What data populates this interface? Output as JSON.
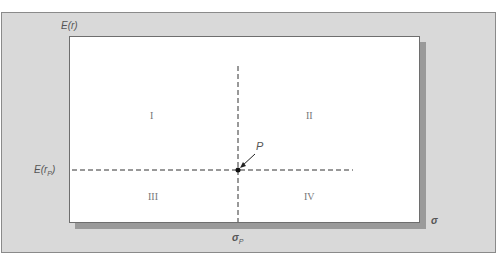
{
  "diagram": {
    "y_axis_label": "E(r)",
    "x_axis_label": "σ",
    "point_label": "P",
    "y_marker_label": "E(r",
    "y_marker_sub": "P",
    "y_marker_close": ")",
    "x_marker_label": "σ",
    "x_marker_sub": "P",
    "quadrants": [
      {
        "id": "I",
        "label": "I"
      },
      {
        "id": "II",
        "label": "II"
      },
      {
        "id": "III",
        "label": "III"
      },
      {
        "id": "IV",
        "label": "IV"
      }
    ],
    "colors": {
      "frame": "#d9d9d9",
      "plot": "#ffffff",
      "shadow": "#9a9a9a",
      "dashed_line": "#333333"
    }
  }
}
